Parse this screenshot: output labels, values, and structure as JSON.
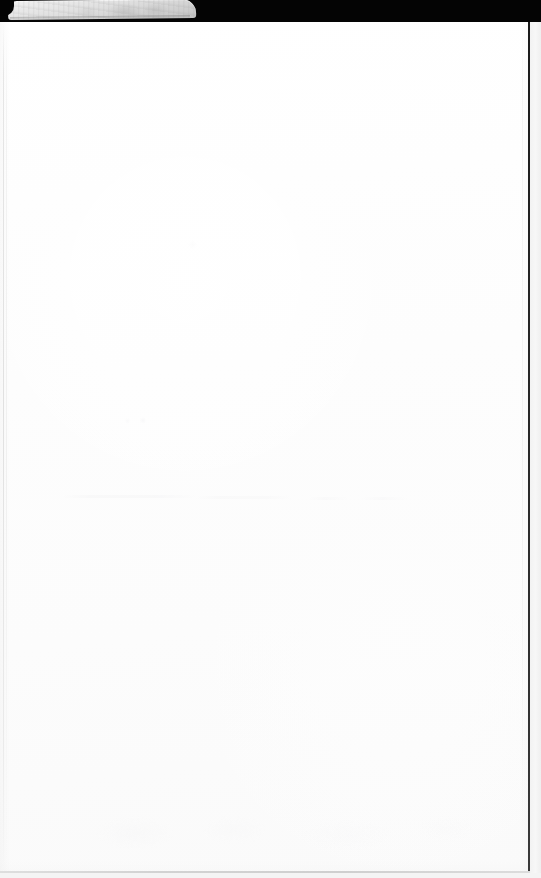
{
  "document": {
    "kind": "scanned-page",
    "subject": "blank white sheet with envelope flap at top edge",
    "page_text": "",
    "visible_text": "",
    "width_px": 541,
    "height_px": 878,
    "orientation": "portrait",
    "content_state": "blank"
  },
  "regions": {
    "top_dark_band": {
      "name": "scanner background band",
      "color": "#040404",
      "height_px": 22
    },
    "envelope_flap": {
      "name": "envelope flap",
      "color": "#dcdcdc",
      "left_px": 8,
      "top_px": 1,
      "width_px": 188,
      "height_px": 19
    },
    "paper_sheet": {
      "name": "paper sheet",
      "color": "#fefefe",
      "left_px": 0,
      "top_px": 21,
      "width_px": 529,
      "height_px": 852
    },
    "right_edge": {
      "name": "right paper edge",
      "color": "#242424",
      "x_px": 528
    },
    "bottom_edge": {
      "name": "bottom paper edge",
      "color": "#d2d2d2",
      "y_px": 871
    },
    "outer_margin": {
      "name": "scanner margin outside sheet",
      "color": "#f4f4f4"
    }
  },
  "marks": {
    "bleedthrough_band": {
      "label": "faint reverse-side bleed-through",
      "y_px": 496,
      "color": "#f1f1f2"
    },
    "bleedthrough_lower": {
      "label": "faint lower bleed-through",
      "y_px": 820,
      "color": "#f4f4f5"
    }
  },
  "colors": {
    "paper": "#fefefe",
    "flap": "#dcdcdc",
    "background": "#040404",
    "edge": "#242424",
    "margin": "#f4f4f4"
  }
}
